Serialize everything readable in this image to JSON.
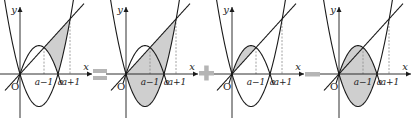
{
  "figure": {
    "colors": {
      "curve": "#1a1a1a",
      "axis": "#1a1a1a",
      "dashed": "#8a8a8a",
      "shade": "#cfcfcf",
      "operator": "#b5b5b5",
      "label": "#222222"
    },
    "labels": {
      "y_axis": "y",
      "x_axis": "x",
      "origin": "O",
      "a_minus_1": "a−1",
      "a": "a",
      "a_plus_1": "a+1"
    },
    "curves": {
      "upward_parabola": "y = k·x(x − a)",
      "downward_parabola": "y = −m·x(x − a)",
      "line": "y = s·x"
    },
    "panels": [
      {
        "id": "panel-1",
        "origin_x": 20,
        "shade": "between line and lower curves on [a−1, a+1]"
      },
      {
        "id": "panel-2",
        "origin_x": 126,
        "shade": "between line and upward parabola on [0, a+1]"
      },
      {
        "id": "panel-3",
        "origin_x": 232,
        "shade": "between downward parabola and line on [0, a−1]"
      },
      {
        "id": "panel-4",
        "origin_x": 339,
        "shade": "between downward and upward parabolas on [0, a]"
      }
    ],
    "operators": [
      {
        "symbol": "=",
        "name": "equals-sign",
        "x": 93
      },
      {
        "symbol": "+",
        "name": "plus-sign",
        "x": 199
      },
      {
        "symbol": "−",
        "name": "minus-sign",
        "x": 305
      }
    ]
  }
}
